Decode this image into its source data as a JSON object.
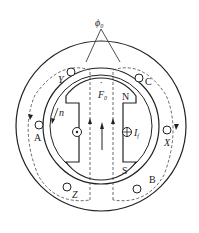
{
  "diagram": {
    "flux_label": "ϕ",
    "flux_sub": "0",
    "mmf_label": "F",
    "mmf_sub": "0",
    "pole_north": "N",
    "pole_south": "S",
    "field_current_label": "I",
    "field_current_sub": "f",
    "speed_label": "n",
    "coils": [
      "A",
      "Y",
      "C",
      "X",
      "B",
      "Z"
    ],
    "colors": {
      "line": "#222222",
      "background": "#ffffff"
    }
  }
}
